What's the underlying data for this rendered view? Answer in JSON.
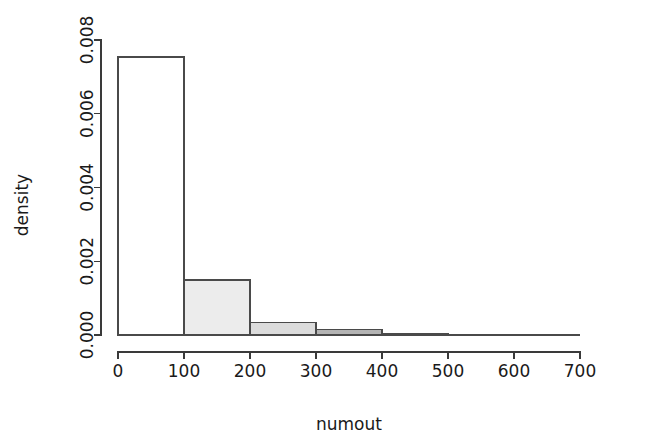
{
  "chart_data": {
    "type": "bar",
    "title": "",
    "subtitle": "",
    "xlabel": "numout",
    "ylabel": "density",
    "grid": false,
    "legend": "none",
    "bin_width": 100,
    "categories": [
      "0-100",
      "100-200",
      "200-300",
      "300-400",
      "400-500",
      "500-600",
      "600-700"
    ],
    "bin_edges": [
      0,
      100,
      200,
      300,
      400,
      500,
      600,
      700
    ],
    "values": [
      0.00754,
      0.00149,
      0.00033,
      0.00014,
      5e-05,
      2e-05,
      0.0
    ],
    "bar_colors": [
      "#ffffff",
      "#ececec",
      "#dcdcdc",
      "#b4b4b4",
      "#8c8c8c",
      "#6e6e6e",
      "#ffffff"
    ],
    "xlim": [
      0,
      700
    ],
    "ylim": [
      0,
      0.008
    ],
    "x_ticks": [
      0,
      100,
      200,
      300,
      400,
      500,
      600,
      700
    ],
    "x_tick_labels": [
      "0",
      "100",
      "200",
      "300",
      "400",
      "500",
      "600",
      "700"
    ],
    "y_ticks": [
      0.0,
      0.002,
      0.004,
      0.006,
      0.008
    ],
    "y_tick_labels": [
      "0.000",
      "0.002",
      "0.004",
      "0.006",
      "0.008"
    ],
    "axis_color": "#3a3a3a",
    "bar_border_color": "#4a4a4a",
    "background": "#ffffff"
  }
}
